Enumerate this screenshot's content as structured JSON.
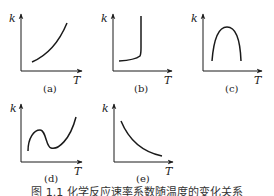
{
  "figure": {
    "caption": "图 1.1  化学反应速率系数随温度的变化关系",
    "panels": [
      {
        "id": "a",
        "label": "(a)",
        "x_axis": "T",
        "y_axis": "k",
        "shape": "increasing, accelerating (exponential-like)"
      },
      {
        "id": "b",
        "label": "(b)",
        "x_axis": "T",
        "y_axis": "k",
        "shape": "slow rise then abrupt near-vertical increase (explosion)"
      },
      {
        "id": "c",
        "label": "(c)",
        "x_axis": "T",
        "y_axis": "k",
        "shape": "rises to maximum then falls (inverted U)"
      },
      {
        "id": "d",
        "label": "(d)",
        "x_axis": "T",
        "y_axis": "k",
        "shape": "rises, falls to a minimum, then rises again"
      },
      {
        "id": "e",
        "label": "(e)",
        "x_axis": "T",
        "y_axis": "k",
        "shape": "decreasing, convex"
      }
    ]
  },
  "colors": {
    "line": "#1a1a1a",
    "background": "#ffffff"
  }
}
